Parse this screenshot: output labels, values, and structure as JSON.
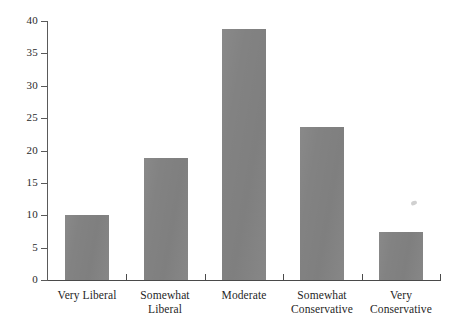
{
  "chart_data": {
    "type": "bar",
    "title": "",
    "subtitle": "",
    "xlabel": "",
    "ylabel": "",
    "categories": [
      "Very Liberal",
      "Somewhat Liberal",
      "Moderate",
      "Somewhat Conservative",
      "Very Conservative"
    ],
    "category_lines": [
      [
        "Very Liberal"
      ],
      [
        "Somewhat",
        "Liberal"
      ],
      [
        "Moderate"
      ],
      [
        "Somewhat",
        "Conservative"
      ],
      [
        "Very",
        "Conservative"
      ]
    ],
    "values": [
      10.0,
      18.8,
      38.7,
      23.7,
      7.4
    ],
    "ylim": [
      0,
      40
    ],
    "yticks": [
      0,
      5,
      10,
      15,
      20,
      25,
      30,
      35,
      40
    ],
    "ytick_labels": [
      "0",
      "5",
      "10",
      "15",
      "20",
      "25",
      "30",
      "35",
      "40"
    ],
    "grid": false,
    "legend": "none",
    "bar_color": "#828282",
    "axis_color": "#4a4a4a",
    "text_color": "#1f1f1f",
    "background_color": "#ffffff"
  },
  "axis": {
    "y_tick_labels": [
      "40",
      "35",
      "30",
      "25",
      "20",
      "15",
      "10",
      "5",
      "0"
    ]
  },
  "bars": [
    {
      "label": "Very Liberal",
      "value": 10.0
    },
    {
      "label": "Somewhat Liberal",
      "value": 18.8
    },
    {
      "label": "Moderate",
      "value": 38.7
    },
    {
      "label": "Somewhat Conservative",
      "value": 23.7
    },
    {
      "label": "Very Conservative",
      "value": 7.4
    }
  ]
}
